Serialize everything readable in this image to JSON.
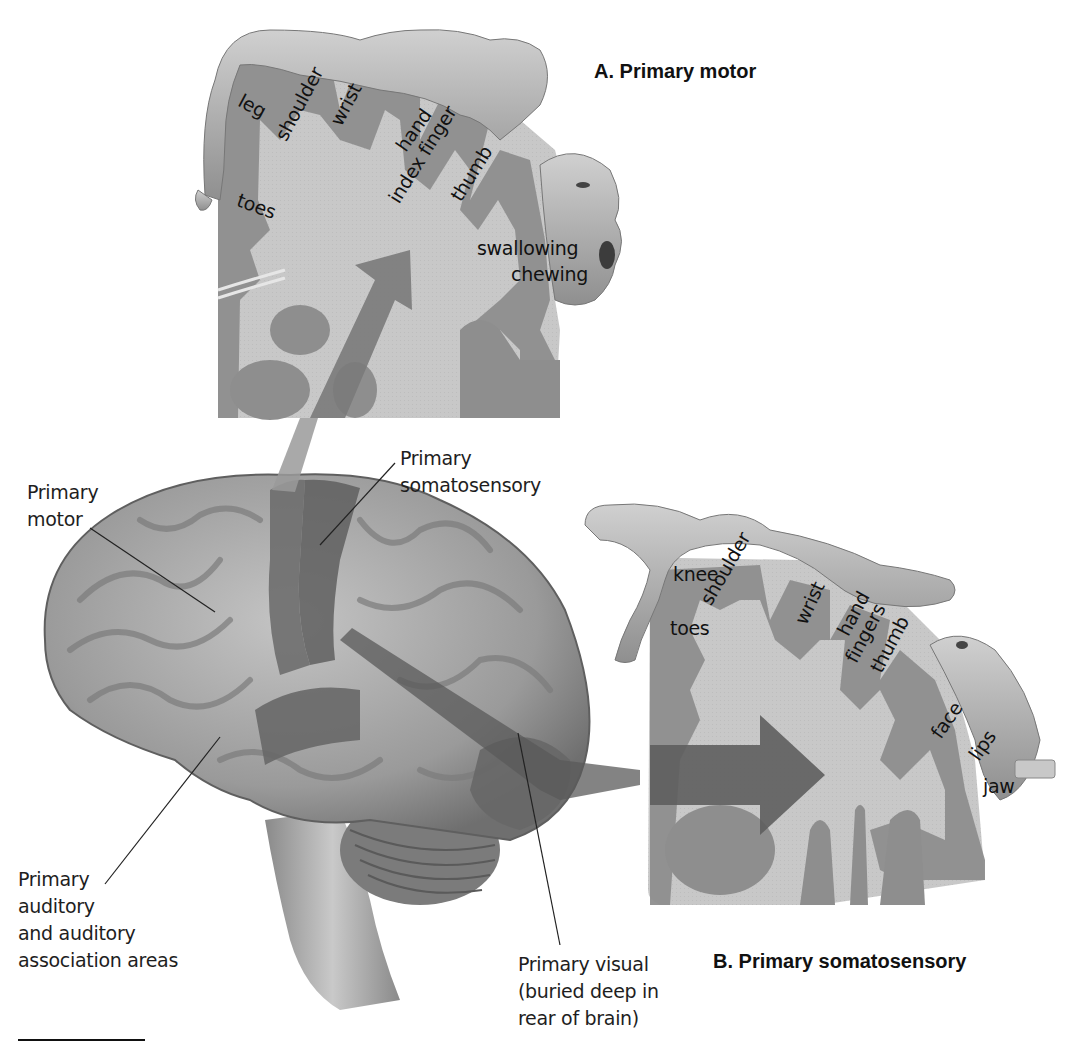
{
  "figure": {
    "colors": {
      "background": "#ffffff",
      "panel_fill": "#c6c6c6",
      "cortex_fill": "#8e8e8e",
      "highlight_area": "#6e6e6e",
      "arrow": "#7a7a7a",
      "brain_surface": "#a9a9a9",
      "text": "#1e1e1e"
    }
  },
  "panel_a": {
    "title": "A. Primary motor",
    "body_labels": [
      "leg",
      "shoulder",
      "wrist",
      "hand",
      "index finger",
      "thumb",
      "toes",
      "swallowing",
      "chewing"
    ]
  },
  "panel_b": {
    "title": "B. Primary somatosensory",
    "body_labels": [
      "knee",
      "shoulder",
      "wrist",
      "hand",
      "fingers",
      "thumb",
      "toes",
      "face",
      "lips",
      "jaw"
    ]
  },
  "brain_labels": {
    "primary_motor": [
      "Primary",
      "motor"
    ],
    "primary_somatosensory": [
      "Primary",
      "somatosensory"
    ],
    "primary_auditory": [
      "Primary",
      "auditory",
      "and auditory",
      "association areas"
    ],
    "primary_visual": [
      "Primary visual",
      "(buried deep in",
      "rear of brain)"
    ]
  }
}
